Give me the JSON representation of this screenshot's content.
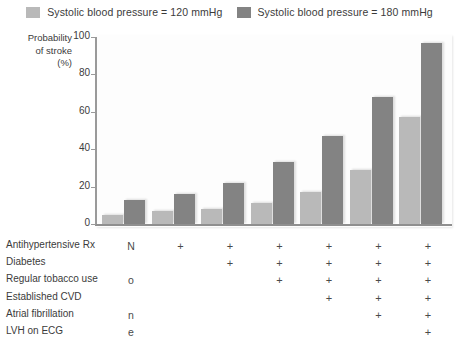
{
  "legend": {
    "entries": [
      {
        "label": "Systolic blood pressure = 120 mmHg",
        "color": "#b9b9b9",
        "key": "sbp120"
      },
      {
        "label": "Systolic blood pressure = 180 mmHg",
        "color": "#838383",
        "key": "sbp180"
      }
    ]
  },
  "axis": {
    "y_title_line1": "Probability",
    "y_title_line2": "of stroke",
    "y_title_line3": "(%)",
    "ticks": [
      "0",
      "20",
      "40",
      "60",
      "80",
      "100"
    ]
  },
  "none_label": {
    "text": "None",
    "letters": [
      "N",
      "o",
      "n",
      "e"
    ]
  },
  "factors": {
    "rows": [
      {
        "label": "Antihypertensive Rx",
        "marks": [
          false,
          true,
          true,
          true,
          true,
          true,
          true
        ]
      },
      {
        "label": "Diabetes",
        "marks": [
          false,
          false,
          true,
          true,
          true,
          true,
          true
        ]
      },
      {
        "label": "Regular tobacco use",
        "marks": [
          false,
          false,
          false,
          true,
          true,
          true,
          true
        ]
      },
      {
        "label": "Established CVD",
        "marks": [
          false,
          false,
          false,
          false,
          true,
          true,
          true
        ]
      },
      {
        "label": "Atrial fibrillation",
        "marks": [
          false,
          false,
          false,
          false,
          false,
          true,
          true
        ]
      },
      {
        "label": "LVH on ECG",
        "marks": [
          false,
          false,
          false,
          false,
          false,
          false,
          true
        ]
      }
    ],
    "mark_symbol": "+"
  },
  "chart_data": {
    "type": "bar",
    "title": "",
    "xlabel": "",
    "ylabel": "Probability of stroke (%)",
    "ylim": [
      0,
      100
    ],
    "grid": false,
    "legend_position": "top",
    "categories": [
      "None",
      "Antihypertensive Rx",
      "+ Diabetes",
      "+ Regular tobacco use",
      "+ Established CVD",
      "+ Atrial fibrillation",
      "+ LVH on ECG"
    ],
    "series": [
      {
        "name": "Systolic blood pressure = 120 mmHg",
        "color": "#b9b9b9",
        "values": [
          5,
          7,
          8,
          11,
          17,
          29,
          57
        ]
      },
      {
        "name": "Systolic blood pressure = 180 mmHg",
        "color": "#838383",
        "values": [
          13,
          16,
          22,
          33,
          47,
          68,
          97
        ]
      }
    ]
  }
}
